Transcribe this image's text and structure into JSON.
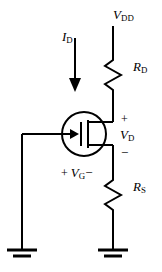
{
  "diagram": {
    "type": "circuit-schematic",
    "width": 162,
    "height": 272,
    "stroke_color": "#000000",
    "background_color": "#ffffff"
  },
  "labels": {
    "vdd": {
      "symbol": "V",
      "subscript": "DD",
      "text": "V"
    },
    "rd": {
      "symbol": "R",
      "subscript": "D",
      "text": "R"
    },
    "rs": {
      "symbol": "R",
      "subscript": "S",
      "text": "R"
    },
    "id": {
      "symbol": "I",
      "subscript": "D",
      "text": "I"
    },
    "vd": {
      "symbol": "V",
      "subscript": "D",
      "text": "V"
    },
    "vg": {
      "symbol": "V",
      "subscript": "G",
      "text": "V"
    },
    "plus_vd": "+",
    "minus_vd": "−",
    "plus_vg": "+",
    "minus_vg": "−"
  },
  "subscripts": {
    "vdd": "DD",
    "rd": "D",
    "rs": "S",
    "id": "D",
    "vd": "D",
    "vg": "G"
  },
  "components": {
    "supply_rail": "vdd-rail",
    "drain_resistor": "resistor-rd",
    "source_resistor": "resistor-rs",
    "transistor": "mosfet-symbol",
    "ground_left": "ground-symbol-gate",
    "ground_right": "ground-symbol-source",
    "current_arrow": "drain-current-arrow"
  }
}
